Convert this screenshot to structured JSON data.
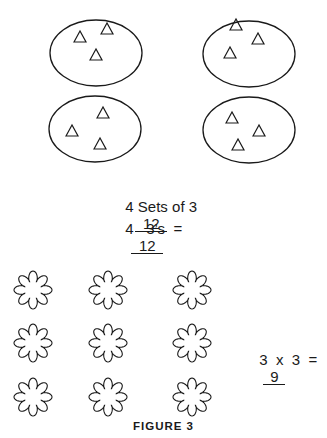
{
  "sets_section": {
    "ellipses": [
      {
        "label": "set-1",
        "cx": 96,
        "cy": 53,
        "triangles": [
          [
            80,
            36
          ],
          [
            107,
            28
          ],
          [
            96,
            54
          ]
        ]
      },
      {
        "label": "set-2",
        "cx": 249,
        "cy": 54,
        "triangles": [
          [
            236,
            24
          ],
          [
            258,
            38
          ],
          [
            230,
            52
          ]
        ]
      },
      {
        "label": "set-3",
        "cx": 95,
        "cy": 129,
        "triangles": [
          [
            103,
            112
          ],
          [
            72,
            130
          ],
          [
            100,
            143
          ]
        ]
      },
      {
        "label": "set-4",
        "cx": 249,
        "cy": 130,
        "triangles": [
          [
            232,
            117
          ],
          [
            259,
            130
          ],
          [
            238,
            144
          ]
        ]
      }
    ],
    "eq1": {
      "text": "4 Sets of 3",
      "answer": "12"
    },
    "eq2": {
      "text": "4   3’s  =",
      "answer": "12"
    }
  },
  "flowers_section": {
    "grid": {
      "rows": 3,
      "cols": 3
    },
    "equation": {
      "text": "3  x  3  =",
      "answer": "9"
    }
  },
  "caption": "FIGURE 3"
}
